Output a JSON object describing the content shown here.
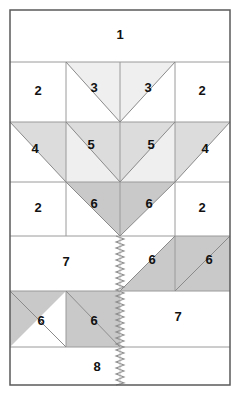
{
  "diagram": {
    "canvas": {
      "width": 240,
      "height": 395
    },
    "colors": {
      "background": "#ffffff",
      "outer_border": "#5a5a5a",
      "grid_line": "#9a9a9a",
      "piece_outline": "#8a8a8a",
      "shade_light": "#efefef",
      "shade_medium": "#dcdcdc",
      "shade_dark": "#c9c9c9",
      "label_text": "#111111",
      "stem_line": "#8c8c8c"
    },
    "frame": {
      "x": 10,
      "y": 10,
      "width": 220,
      "height": 375,
      "stroke_width": 1.5
    },
    "rows": [
      {
        "name": "row-1-top-strip",
        "y_top": 10,
        "y_bottom": 62,
        "labels": [
          "1"
        ]
      },
      {
        "name": "row-2-upper-leaf",
        "y_top": 62,
        "y_bottom": 122,
        "labels": [
          "2",
          "3",
          "3",
          "2"
        ]
      },
      {
        "name": "row-3-mid-leaf",
        "y_top": 122,
        "y_bottom": 182,
        "labels": [
          "4",
          "5",
          "5",
          "4"
        ]
      },
      {
        "name": "row-4-lower-leaf",
        "y_top": 182,
        "y_bottom": 236,
        "labels": [
          "2",
          "6",
          "6",
          "2"
        ]
      },
      {
        "name": "row-5-right-diagonals",
        "y_top": 236,
        "y_bottom": 291,
        "labels": [
          "7",
          "6",
          "6"
        ]
      },
      {
        "name": "row-6-left-diagonals",
        "y_top": 291,
        "y_bottom": 347,
        "labels": [
          "6",
          "6",
          "7"
        ]
      },
      {
        "name": "row-7-bottom-strip",
        "y_top": 347,
        "y_bottom": 385,
        "labels": [
          "8"
        ]
      }
    ],
    "columns": {
      "left_edge": 10,
      "c1": 66,
      "center": 120,
      "c3": 175,
      "right_edge": 230
    },
    "stem": {
      "name": "zigzag-stem",
      "x": 120,
      "y_top": 236,
      "y_bottom": 385,
      "amplitude": 4,
      "period": 6
    },
    "pieces": [
      {
        "id": "p1",
        "number": "1",
        "label_x": 120,
        "label_y": 36,
        "shade": "none"
      },
      {
        "id": "p2a",
        "number": "2",
        "label_x": 38,
        "label_y": 92,
        "shade": "none"
      },
      {
        "id": "p3a",
        "number": "3",
        "label_x": 94,
        "label_y": 89,
        "shade": "light"
      },
      {
        "id": "p3b",
        "number": "3",
        "label_x": 148,
        "label_y": 89,
        "shade": "light"
      },
      {
        "id": "p2b",
        "number": "2",
        "label_x": 202,
        "label_y": 92,
        "shade": "none"
      },
      {
        "id": "p4a",
        "number": "4",
        "label_x": 35,
        "label_y": 150,
        "shade": "medium"
      },
      {
        "id": "p5a",
        "number": "5",
        "label_x": 91,
        "label_y": 146,
        "shade": "light"
      },
      {
        "id": "p5b",
        "number": "5",
        "label_x": 151,
        "label_y": 146,
        "shade": "light"
      },
      {
        "id": "p4b",
        "number": "4",
        "label_x": 205,
        "label_y": 150,
        "shade": "medium"
      },
      {
        "id": "p2c",
        "number": "2",
        "label_x": 38,
        "label_y": 209,
        "shade": "none"
      },
      {
        "id": "p6a",
        "number": "6",
        "label_x": 94,
        "label_y": 205,
        "shade": "dark"
      },
      {
        "id": "p6b",
        "number": "6",
        "label_x": 149,
        "label_y": 205,
        "shade": "dark"
      },
      {
        "id": "p2d",
        "number": "2",
        "label_x": 202,
        "label_y": 209,
        "shade": "none"
      },
      {
        "id": "p7a",
        "number": "7",
        "label_x": 66,
        "label_y": 263,
        "shade": "none"
      },
      {
        "id": "p6c",
        "number": "6",
        "label_x": 152,
        "label_y": 261,
        "shade": "dark"
      },
      {
        "id": "p6d",
        "number": "6",
        "label_x": 209,
        "label_y": 261,
        "shade": "dark"
      },
      {
        "id": "p6e",
        "number": "6",
        "label_x": 41,
        "label_y": 322,
        "shade": "dark"
      },
      {
        "id": "p6f",
        "number": "6",
        "label_x": 94,
        "label_y": 322,
        "shade": "dark"
      },
      {
        "id": "p7b",
        "number": "7",
        "label_x": 178,
        "label_y": 318,
        "shade": "none"
      },
      {
        "id": "p8",
        "number": "8",
        "label_x": 97,
        "label_y": 368,
        "shade": "none"
      }
    ]
  }
}
